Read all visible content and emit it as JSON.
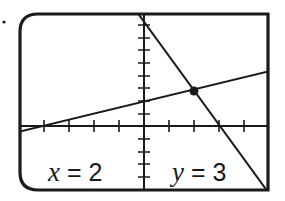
{
  "screen": {
    "title": "Graphing calculator screen",
    "intersection_label": {
      "x_text": "x = 2",
      "x_var": "x",
      "x_value": "2",
      "y_text": "y = 3",
      "y_var": "y",
      "y_value": "3"
    },
    "window": {
      "xmin": -5,
      "xmax": 5,
      "xscl": 1,
      "ymin": -5,
      "ymax": 9,
      "yscl": 1
    },
    "lines": [
      {
        "name": "steep-line",
        "slope": -3,
        "y_intercept": 9
      },
      {
        "name": "shallow-line",
        "slope": 0.5,
        "y_intercept": 2
      }
    ],
    "intersection_point": {
      "x": 2,
      "y": 3
    },
    "colors": {
      "stroke": "#1a1a1a",
      "background": "#ffffff"
    }
  }
}
